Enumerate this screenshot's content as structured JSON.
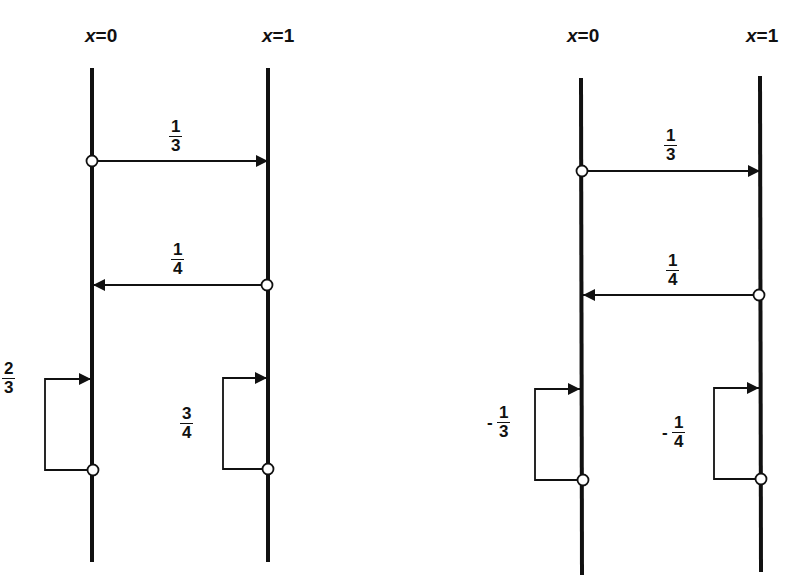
{
  "diagrams": [
    {
      "id": "left",
      "axes": [
        {
          "var": "x",
          "eq": "=0"
        },
        {
          "var": "x",
          "eq": "=1"
        }
      ],
      "transitions": [
        {
          "from": "x=0",
          "to": "x=1",
          "num": "1",
          "den": "3",
          "sign": ""
        },
        {
          "from": "x=1",
          "to": "x=0",
          "num": "1",
          "den": "4",
          "sign": ""
        },
        {
          "from": "x=0",
          "to": "x=0",
          "num": "2",
          "den": "3",
          "sign": ""
        },
        {
          "from": "x=1",
          "to": "x=1",
          "num": "3",
          "den": "4",
          "sign": ""
        }
      ]
    },
    {
      "id": "right",
      "axes": [
        {
          "var": "x",
          "eq": "=0"
        },
        {
          "var": "x",
          "eq": "=1"
        }
      ],
      "transitions": [
        {
          "from": "x=0",
          "to": "x=1",
          "num": "1",
          "den": "3",
          "sign": ""
        },
        {
          "from": "x=1",
          "to": "x=0",
          "num": "1",
          "den": "4",
          "sign": ""
        },
        {
          "from": "x=0",
          "to": "x=0",
          "num": "1",
          "den": "3",
          "sign": "-"
        },
        {
          "from": "x=1",
          "to": "x=1",
          "num": "1",
          "den": "4",
          "sign": "-"
        }
      ]
    }
  ],
  "colors": {
    "ink": "#111111",
    "background": "#ffffff"
  }
}
